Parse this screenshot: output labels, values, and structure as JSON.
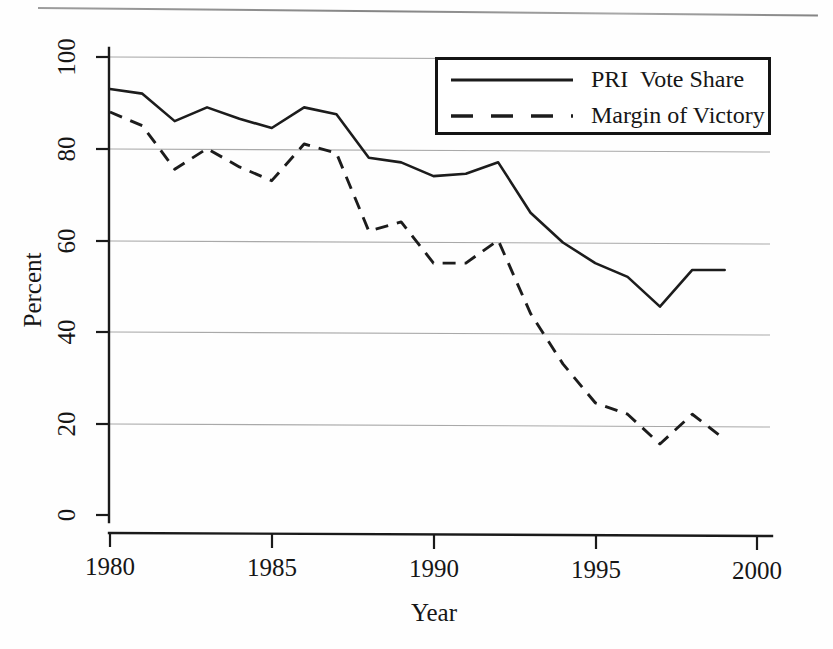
{
  "chart_data": {
    "type": "line",
    "title": "",
    "xlabel": "Year",
    "ylabel": "Percent",
    "xlim": [
      1980,
      2000
    ],
    "ylim": [
      0,
      100
    ],
    "xticks": [
      1980,
      1985,
      1990,
      1995,
      2000
    ],
    "yticks": [
      0,
      20,
      40,
      60,
      80,
      100
    ],
    "grid": "horizontal",
    "legend_position": "top-right",
    "x": [
      1980,
      1981,
      1982,
      1983,
      1984,
      1985,
      1986,
      1987,
      1988,
      1989,
      1990,
      1991,
      1992,
      1993,
      1994,
      1995,
      1996,
      1997,
      1998,
      1999
    ],
    "series": [
      {
        "name": "PRI  Vote Share",
        "style": "solid",
        "values": [
          93,
          92,
          86,
          89,
          86.5,
          84.5,
          89,
          87.5,
          78,
          77,
          74,
          74.5,
          77,
          66,
          59.5,
          55,
          52,
          45.5,
          53.5,
          53.5
        ]
      },
      {
        "name": "Margin of Victory",
        "style": "dashed",
        "values": [
          88,
          85,
          75.5,
          80,
          76,
          73,
          81,
          79,
          62,
          64,
          55,
          55,
          60,
          44,
          33,
          24.5,
          22,
          15.5,
          22,
          16.5
        ]
      }
    ]
  },
  "axes": {
    "y_title": "Percent",
    "x_title": "Year",
    "y_tick_labels": [
      "0",
      "20",
      "40",
      "60",
      "80",
      "100"
    ],
    "x_tick_labels": [
      "1980",
      "1985",
      "1990",
      "1995",
      "2000"
    ]
  },
  "legend": {
    "entries": [
      {
        "label": "PRI  Vote Share",
        "style": "solid"
      },
      {
        "label": "Margin of Victory",
        "style": "dashed"
      }
    ]
  },
  "colors": {
    "ink": "#1a1a1a",
    "gridline": "#a9a9a9",
    "background": "#ffffff"
  }
}
